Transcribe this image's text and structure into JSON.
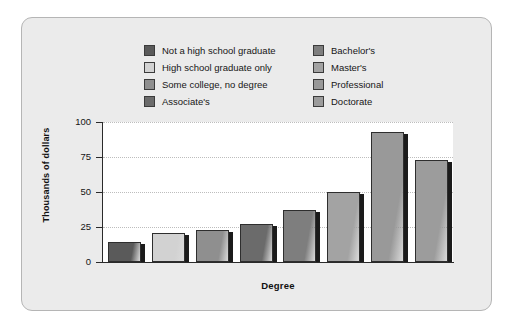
{
  "chart_data": {
    "type": "bar",
    "title": "",
    "xlabel": "Degree",
    "ylabel": "Thousands of dollars",
    "categories": [
      "Not a high school graduate",
      "High school graduate only",
      "Some college, no degree",
      "Associate's",
      "Bachelor's",
      "Master's",
      "Professional",
      "Doctorate"
    ],
    "values": [
      14,
      21,
      23,
      27,
      37,
      50,
      93,
      73
    ],
    "ylim": [
      0,
      100
    ],
    "yticks": [
      0,
      25,
      50,
      75,
      100
    ],
    "ytick_labels": [
      "0",
      "25",
      "50",
      "75",
      "100"
    ],
    "grid": true,
    "legend_position": "top",
    "bar_colors": [
      "#5a5a5a",
      "#d2d2d2",
      "#8f8f8f",
      "#6b6b6b",
      "#7e7e7e",
      "#a3a3a3",
      "#999999",
      "#9c9c9c"
    ]
  },
  "legend": {
    "left_column": [
      {
        "label": "Not a high school graduate",
        "color": "#5a5a5a"
      },
      {
        "label": "High school graduate only",
        "color": "#d2d2d2"
      },
      {
        "label": "Some college, no degree",
        "color": "#8f8f8f"
      },
      {
        "label": "Associate's",
        "color": "#6b6b6b"
      }
    ],
    "right_column": [
      {
        "label": "Bachelor's",
        "color": "#7e7e7e"
      },
      {
        "label": "Master's",
        "color": "#a3a3a3"
      },
      {
        "label": "Professional",
        "color": "#999999"
      },
      {
        "label": "Doctorate",
        "color": "#9c9c9c"
      }
    ]
  },
  "axes": {
    "y_title": "Thousands of dollars",
    "x_title": "Degree"
  }
}
